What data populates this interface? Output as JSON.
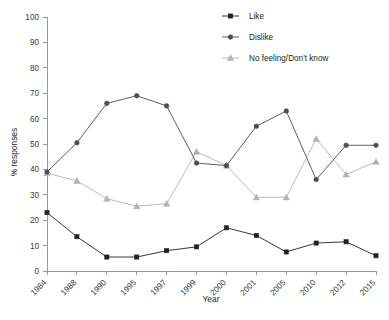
{
  "chart_data": {
    "type": "line",
    "title": "",
    "xlabel": "Year",
    "ylabel": "% responses",
    "categories": [
      "1984",
      "1988",
      "1990",
      "1995",
      "1997",
      "1999",
      "2000",
      "2001",
      "2005",
      "2010",
      "2012",
      "2015"
    ],
    "ylim": [
      0,
      100
    ],
    "yticks": [
      0,
      10,
      20,
      30,
      40,
      50,
      60,
      70,
      80,
      90,
      100
    ],
    "grid": false,
    "legend_position": "top-right",
    "series": [
      {
        "name": "Like",
        "marker": "square",
        "color": "#231f20",
        "values": [
          23,
          13.5,
          5.5,
          5.5,
          8,
          9.5,
          17,
          14,
          7.5,
          11,
          11.5,
          6
        ]
      },
      {
        "name": "Dislike",
        "marker": "circle",
        "color": "#4d4d4d",
        "values": [
          39,
          50.5,
          66,
          69,
          65,
          42.5,
          41.5,
          57,
          63,
          36,
          49.5,
          49.5
        ]
      },
      {
        "name": "No feeling/Don't know",
        "marker": "triangle",
        "color": "#b3b3b3",
        "values": [
          38.5,
          35.5,
          28.5,
          25.5,
          26.5,
          47,
          41.5,
          29,
          29,
          52,
          38,
          43
        ]
      }
    ]
  },
  "legend": {
    "items": [
      {
        "label": "Like"
      },
      {
        "label": "Dislike"
      },
      {
        "label": "No feeling/Don't know"
      }
    ]
  },
  "axes": {
    "y_title": "% responses",
    "x_title": "Year"
  }
}
